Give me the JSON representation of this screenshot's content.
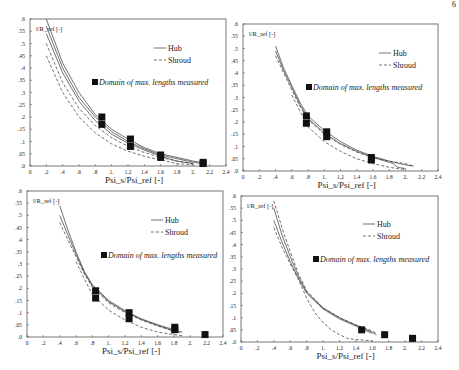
{
  "page": {
    "number": "6"
  },
  "colors": {
    "frame": "#555555",
    "curve": "#333333",
    "marker": "#111111",
    "text": "#222222"
  },
  "chart_data": [
    {
      "type": "line",
      "panel": "top-left",
      "title": "",
      "ylabel": "l/R_ref [-]",
      "xlabel": "Psi_s/Psi_ref [-]",
      "xlim": [
        0,
        2.4
      ],
      "ylim": [
        0,
        0.6
      ],
      "x_ticks": [
        "0",
        ".2",
        ".4",
        ".6",
        ".8",
        "1.",
        "1.2",
        "1.4",
        "1.6",
        "1.8",
        "2.",
        "2.2",
        "2.4"
      ],
      "y_ticks": [
        ".0",
        ".05",
        ".1",
        ".15",
        ".2",
        ".25",
        ".3",
        ".35",
        ".4",
        ".45",
        ".5",
        ".55",
        ".6"
      ],
      "legend": {
        "entries": [
          "Hub",
          "Shroud"
        ],
        "marker_label": "Domain of max. lengths measured"
      },
      "series": [
        {
          "name": "Hub",
          "style": "solid",
          "points": [
            [
              0.2,
              0.6
            ],
            [
              0.4,
              0.42
            ],
            [
              0.6,
              0.3
            ],
            [
              0.8,
              0.21
            ],
            [
              1.0,
              0.15
            ],
            [
              1.2,
              0.11
            ],
            [
              1.4,
              0.075
            ],
            [
              1.6,
              0.05
            ],
            [
              1.8,
              0.035
            ],
            [
              2.0,
              0.02
            ],
            [
              2.1,
              0.015
            ]
          ]
        },
        {
          "name": "Hub",
          "style": "solid",
          "points": [
            [
              0.2,
              0.57
            ],
            [
              0.4,
              0.4
            ],
            [
              0.6,
              0.28
            ],
            [
              0.8,
              0.2
            ],
            [
              1.0,
              0.14
            ],
            [
              1.2,
              0.1
            ],
            [
              1.4,
              0.07
            ],
            [
              1.6,
              0.045
            ],
            [
              1.8,
              0.03
            ],
            [
              2.0,
              0.015
            ],
            [
              2.1,
              0.01
            ]
          ]
        },
        {
          "name": "Hub",
          "style": "solid",
          "points": [
            [
              0.2,
              0.54
            ],
            [
              0.4,
              0.38
            ],
            [
              0.6,
              0.265
            ],
            [
              0.8,
              0.185
            ],
            [
              1.0,
              0.13
            ],
            [
              1.2,
              0.093
            ],
            [
              1.4,
              0.065
            ],
            [
              1.6,
              0.04
            ],
            [
              1.7,
              0.03
            ],
            [
              1.8,
              0.02
            ],
            [
              2.0,
              0.01
            ]
          ]
        },
        {
          "name": "Shroud",
          "style": "dashed",
          "points": [
            [
              0.2,
              0.5
            ],
            [
              0.4,
              0.34
            ],
            [
              0.6,
              0.235
            ],
            [
              0.8,
              0.165
            ],
            [
              1.0,
              0.115
            ],
            [
              1.2,
              0.08
            ],
            [
              1.4,
              0.055
            ],
            [
              1.6,
              0.035
            ],
            [
              1.8,
              0.02
            ],
            [
              2.0,
              0.01
            ]
          ]
        },
        {
          "name": "Shroud",
          "style": "dashed",
          "points": [
            [
              0.2,
              0.45
            ],
            [
              0.4,
              0.3
            ],
            [
              0.6,
              0.2
            ],
            [
              0.8,
              0.135
            ],
            [
              1.0,
              0.09
            ],
            [
              1.2,
              0.06
            ],
            [
              1.4,
              0.04
            ],
            [
              1.6,
              0.025
            ],
            [
              1.8,
              0.01
            ],
            [
              2.0,
              0.005
            ]
          ]
        }
      ],
      "markers": [
        [
          0.88,
          0.2
        ],
        [
          0.88,
          0.17
        ],
        [
          1.23,
          0.11
        ],
        [
          1.23,
          0.08
        ],
        [
          1.6,
          0.045
        ],
        [
          1.6,
          0.035
        ],
        [
          2.12,
          0.015
        ],
        [
          2.12,
          0.01
        ]
      ]
    },
    {
      "type": "line",
      "panel": "top-right",
      "title": "",
      "ylabel": "l/R_ref [-]",
      "xlabel": "Psi_s/Psi_ref [-]",
      "xlim": [
        0,
        2.4
      ],
      "ylim": [
        0,
        0.6
      ],
      "x_ticks": [
        "0",
        ".2",
        ".4",
        ".6",
        ".8",
        "1.",
        "1.2",
        "1.4",
        "1.6",
        "1.8",
        "2.",
        "2.2",
        "2.4"
      ],
      "y_ticks": [
        ".0",
        ".05",
        ".1",
        ".15",
        ".2",
        ".25",
        ".3",
        ".35",
        ".4",
        ".45",
        ".5",
        ".55",
        ".6"
      ],
      "legend": {
        "entries": [
          "Hub",
          "Shroud"
        ],
        "marker_label": "Domain of max. lengths measured"
      },
      "series": [
        {
          "name": "Hub",
          "style": "solid",
          "points": [
            [
              0.4,
              0.51
            ],
            [
              0.5,
              0.42
            ],
            [
              0.6,
              0.35
            ],
            [
              0.7,
              0.28
            ],
            [
              0.8,
              0.225
            ],
            [
              1.0,
              0.165
            ],
            [
              1.2,
              0.12
            ],
            [
              1.4,
              0.085
            ],
            [
              1.6,
              0.06
            ],
            [
              1.8,
              0.04
            ],
            [
              2.0,
              0.025
            ],
            [
              2.1,
              0.02
            ]
          ]
        },
        {
          "name": "Hub",
          "style": "solid",
          "points": [
            [
              0.4,
              0.49
            ],
            [
              0.5,
              0.41
            ],
            [
              0.6,
              0.34
            ],
            [
              0.7,
              0.27
            ],
            [
              0.8,
              0.215
            ],
            [
              1.0,
              0.155
            ],
            [
              1.2,
              0.112
            ],
            [
              1.4,
              0.08
            ],
            [
              1.6,
              0.055
            ],
            [
              1.8,
              0.035
            ],
            [
              1.85,
              0.03
            ],
            [
              1.9,
              0.015
            ],
            [
              2.0,
              0.01
            ]
          ]
        },
        {
          "name": "Shroud",
          "style": "dashed",
          "points": [
            [
              0.4,
              0.47
            ],
            [
              0.5,
              0.4
            ],
            [
              0.6,
              0.33
            ],
            [
              0.7,
              0.265
            ],
            [
              0.8,
              0.21
            ],
            [
              1.0,
              0.15
            ],
            [
              1.2,
              0.108
            ],
            [
              1.4,
              0.077
            ],
            [
              1.6,
              0.055
            ],
            [
              1.8,
              0.04
            ],
            [
              2.0,
              0.03
            ],
            [
              2.1,
              0.02
            ]
          ]
        },
        {
          "name": "Shroud",
          "style": "dashed",
          "points": [
            [
              0.6,
              0.31
            ],
            [
              0.7,
              0.245
            ],
            [
              0.8,
              0.18
            ],
            [
              1.0,
              0.12
            ],
            [
              1.2,
              0.08
            ],
            [
              1.4,
              0.05
            ],
            [
              1.6,
              0.03
            ],
            [
              1.8,
              0.015
            ],
            [
              2.0,
              0.005
            ]
          ]
        }
      ],
      "markers": [
        [
          0.78,
          0.225
        ],
        [
          0.78,
          0.195
        ],
        [
          1.03,
          0.16
        ],
        [
          1.03,
          0.14
        ],
        [
          1.58,
          0.055
        ],
        [
          1.58,
          0.045
        ]
      ]
    },
    {
      "type": "line",
      "panel": "bottom-left",
      "title": "",
      "ylabel": "l/R_ref [-]",
      "xlabel": "Psi_s/Psi_ref [-]",
      "xlim": [
        0,
        2.4
      ],
      "ylim": [
        0,
        0.6
      ],
      "x_ticks": [
        "0",
        ".2",
        ".4",
        ".6",
        ".8",
        "1.",
        "1.2",
        "1.4",
        "1.6",
        "1.8",
        "2.",
        "2.2",
        "2.4"
      ],
      "y_ticks": [
        ".0",
        ".05",
        ".1",
        ".15",
        ".2",
        ".25",
        ".3",
        ".35",
        ".4",
        ".45",
        ".5",
        ".55",
        ".6"
      ],
      "legend": {
        "entries": [
          "Hub",
          "Shroud"
        ],
        "marker_label": "Domain of max. lengths measured"
      },
      "series": [
        {
          "name": "Hub",
          "style": "solid",
          "points": [
            [
              0.4,
              0.54
            ],
            [
              0.5,
              0.44
            ],
            [
              0.6,
              0.35
            ],
            [
              0.7,
              0.27
            ],
            [
              0.8,
              0.215
            ],
            [
              1.0,
              0.15
            ],
            [
              1.2,
              0.108
            ],
            [
              1.4,
              0.075
            ],
            [
              1.6,
              0.05
            ],
            [
              1.8,
              0.03
            ],
            [
              1.9,
              0.02
            ]
          ]
        },
        {
          "name": "Hub",
          "style": "solid",
          "points": [
            [
              0.4,
              0.5
            ],
            [
              0.5,
              0.42
            ],
            [
              0.6,
              0.34
            ],
            [
              0.7,
              0.265
            ],
            [
              0.8,
              0.21
            ],
            [
              1.0,
              0.145
            ],
            [
              1.2,
              0.104
            ],
            [
              1.4,
              0.072
            ],
            [
              1.6,
              0.048
            ],
            [
              1.75,
              0.03
            ],
            [
              1.8,
              0.01
            ]
          ]
        },
        {
          "name": "Shroud",
          "style": "dashed",
          "points": [
            [
              0.4,
              0.47
            ],
            [
              0.5,
              0.4
            ],
            [
              0.6,
              0.33
            ],
            [
              0.7,
              0.26
            ],
            [
              0.8,
              0.205
            ],
            [
              1.0,
              0.14
            ],
            [
              1.2,
              0.1
            ],
            [
              1.4,
              0.07
            ],
            [
              1.6,
              0.045
            ],
            [
              1.8,
              0.025
            ],
            [
              1.9,
              0.015
            ]
          ]
        },
        {
          "name": "Shroud",
          "style": "dashed",
          "points": [
            [
              0.6,
              0.31
            ],
            [
              0.7,
              0.24
            ],
            [
              0.8,
              0.175
            ],
            [
              1.0,
              0.11
            ],
            [
              1.2,
              0.07
            ],
            [
              1.4,
              0.04
            ],
            [
              1.6,
              0.02
            ],
            [
              1.8,
              0.01
            ],
            [
              1.9,
              0.005
            ]
          ]
        }
      ],
      "markers": [
        [
          0.84,
          0.19
        ],
        [
          0.84,
          0.16
        ],
        [
          1.25,
          0.1
        ],
        [
          1.25,
          0.075
        ],
        [
          1.81,
          0.04
        ],
        [
          1.81,
          0.03
        ],
        [
          2.18,
          0.01
        ]
      ]
    },
    {
      "type": "line",
      "panel": "bottom-right",
      "title": "",
      "ylabel": "l/R_ref [-]",
      "xlabel": "Psi_s/Psi_ref [-]",
      "xlim": [
        0,
        2.4
      ],
      "ylim": [
        0,
        0.6
      ],
      "x_ticks": [
        "0",
        ".2",
        ".4",
        ".6",
        ".8",
        "1.",
        "1.2",
        "1.4",
        "1.6",
        "1.8",
        "2.",
        "2.2",
        "2.4"
      ],
      "y_ticks": [
        ".0",
        ".05",
        ".1",
        ".15",
        ".2",
        ".25",
        ".3",
        ".35",
        ".4",
        ".45",
        ".5",
        ".55",
        ".6"
      ],
      "legend": {
        "entries": [
          "Hub",
          "Shroud"
        ],
        "marker_label": "Domain of max. lengths measured"
      },
      "series": [
        {
          "name": "Shroud",
          "style": "dashed",
          "points": [
            [
              0.4,
              0.58
            ],
            [
              0.5,
              0.47
            ],
            [
              0.6,
              0.37
            ],
            [
              0.7,
              0.28
            ],
            [
              0.8,
              0.21
            ],
            [
              1.0,
              0.14
            ],
            [
              1.2,
              0.1
            ],
            [
              1.4,
              0.07
            ],
            [
              1.5,
              0.058
            ],
            [
              1.6,
              0.045
            ],
            [
              1.65,
              0.035
            ]
          ]
        },
        {
          "name": "Hub",
          "style": "solid",
          "points": [
            [
              0.4,
              0.55
            ],
            [
              0.5,
              0.44
            ],
            [
              0.6,
              0.35
            ],
            [
              0.7,
              0.27
            ],
            [
              0.8,
              0.205
            ],
            [
              1.0,
              0.14
            ],
            [
              1.2,
              0.1
            ],
            [
              1.4,
              0.07
            ],
            [
              1.5,
              0.055
            ],
            [
              1.6,
              0.04
            ],
            [
              1.65,
              0.03
            ]
          ]
        },
        {
          "name": "Hub",
          "style": "solid",
          "points": [
            [
              0.4,
              0.5
            ],
            [
              0.5,
              0.41
            ],
            [
              0.6,
              0.33
            ],
            [
              0.7,
              0.26
            ],
            [
              0.8,
              0.2
            ],
            [
              1.0,
              0.135
            ],
            [
              1.2,
              0.095
            ],
            [
              1.4,
              0.065
            ],
            [
              1.5,
              0.05
            ],
            [
              1.6,
              0.035
            ]
          ]
        },
        {
          "name": "Shroud",
          "style": "dashed",
          "points": [
            [
              0.4,
              0.47
            ],
            [
              0.5,
              0.39
            ],
            [
              0.6,
              0.32
            ],
            [
              0.7,
              0.255
            ],
            [
              0.8,
              0.18
            ],
            [
              0.9,
              0.12
            ],
            [
              1.0,
              0.08
            ],
            [
              1.1,
              0.05
            ],
            [
              1.2,
              0.03
            ],
            [
              1.3,
              0.015
            ],
            [
              1.4,
              0.01
            ],
            [
              1.6,
              0.005
            ]
          ]
        }
      ],
      "markers": [
        [
          1.47,
          0.05
        ],
        [
          1.75,
          0.03
        ],
        [
          2.09,
          0.015
        ]
      ]
    }
  ]
}
